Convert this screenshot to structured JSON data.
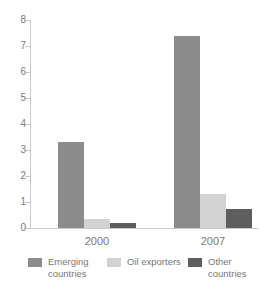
{
  "chart_data": {
    "type": "bar",
    "title": "",
    "subtitle": "",
    "xlabel": "",
    "ylabel": "",
    "categories": [
      "2000",
      "2007"
    ],
    "series": [
      {
        "name": "Emerging countries",
        "label_lines": "Emerging\ncountries",
        "color": "#8c8c8c",
        "values": [
          3.3,
          7.4
        ]
      },
      {
        "name": "Oil exporters",
        "label_lines": "Oil exporters",
        "color": "#d2d2d2",
        "values": [
          0.35,
          1.3
        ]
      },
      {
        "name": "Other countries",
        "label_lines": "Other\ncountries",
        "color": "#5e5e5e",
        "values": [
          0.2,
          0.75
        ]
      }
    ],
    "ylim": [
      0,
      8
    ],
    "yticks": [
      0,
      1,
      2,
      3,
      4,
      5,
      6,
      7,
      8
    ],
    "ytick_labels": [
      "0",
      "1",
      "2",
      "3",
      "4",
      "5",
      "6",
      "7",
      "8"
    ],
    "grid": false,
    "legend_position": "bottom",
    "axis_color": "#c9c9c9",
    "text_color": "#777777"
  },
  "axis": {
    "ticks": [
      {
        "value": 8,
        "label": "8"
      },
      {
        "value": 7,
        "label": "7"
      },
      {
        "value": 6,
        "label": "6"
      },
      {
        "value": 5,
        "label": "5"
      },
      {
        "value": 4,
        "label": "4"
      },
      {
        "value": 3,
        "label": "3"
      },
      {
        "value": 2,
        "label": "2"
      },
      {
        "value": 1,
        "label": "1"
      },
      {
        "value": 0,
        "label": "0"
      }
    ]
  },
  "categories": [
    {
      "label": "2000"
    },
    {
      "label": "2007"
    }
  ],
  "legend": {
    "items": [
      {
        "label": "Emerging\ncountries",
        "color": "#8c8c8c"
      },
      {
        "label": "Oil exporters",
        "color": "#d2d2d2"
      },
      {
        "label": "Other\ncountries",
        "color": "#5e5e5e"
      }
    ]
  }
}
